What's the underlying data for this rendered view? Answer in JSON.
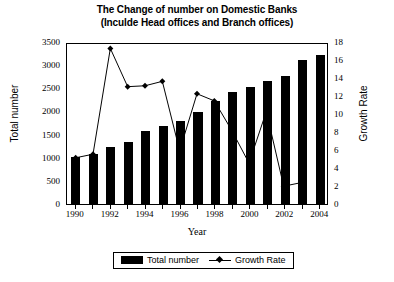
{
  "chart_data": {
    "type": "bar",
    "title": "The Change of number on Domestic Banks",
    "subtitle": "(Inculde Head offices and Branch offices)",
    "xlabel": "Year",
    "ylabel": "Total number",
    "y2label": "Growth Rate",
    "categories": [
      "1990",
      "1991",
      "1992",
      "1993",
      "1994",
      "1995",
      "1996",
      "1997",
      "1998",
      "1999",
      "2000",
      "2001",
      "2002",
      "2003",
      "2004"
    ],
    "xtick_labels": [
      "1990",
      "1992",
      "1994",
      "1996",
      "1998",
      "2000",
      "2002",
      "2004"
    ],
    "ylim": [
      0,
      3500
    ],
    "y2lim": [
      0,
      18
    ],
    "yticks": [
      "0",
      "500",
      "1000",
      "1500",
      "2000",
      "2500",
      "3000",
      "3500"
    ],
    "y2ticks": [
      "0",
      "2",
      "4",
      "6",
      "8",
      "10",
      "12",
      "14",
      "16",
      "18"
    ],
    "grid": false,
    "legend_position": "bottom",
    "series": [
      {
        "name": "Total number",
        "type": "bar",
        "axis": "left",
        "color": "#000000",
        "values": [
          1020,
          1080,
          1230,
          1350,
          1580,
          1680,
          1790,
          1990,
          2230,
          2420,
          2520,
          2650,
          2760,
          3120,
          3230
        ]
      },
      {
        "name": "Growth Rate",
        "type": "line",
        "axis": "right",
        "color": "#000000",
        "marker": "diamond",
        "values": [
          5.2,
          5.6,
          17.5,
          13.2,
          13.3,
          13.8,
          6.0,
          12.4,
          11.6,
          8.3,
          4.6,
          10.4,
          2.0,
          2.4,
          null
        ]
      }
    ]
  },
  "legend": {
    "items": [
      {
        "label": "Total number",
        "marker": "bar-swatch"
      },
      {
        "label": "Growth Rate",
        "marker": "line-diamond-swatch"
      }
    ]
  }
}
